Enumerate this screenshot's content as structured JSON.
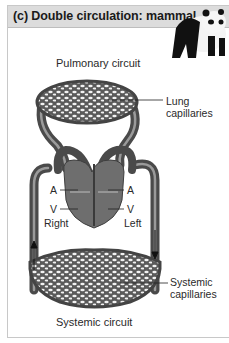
{
  "figure": {
    "title": "(c) Double circulation: mammal",
    "animal_icon": "panda-icon",
    "labels": {
      "pulmonary_circuit": "Pulmonary circuit",
      "lung_capillaries_line1": "Lung",
      "lung_capillaries_line2": "capillaries",
      "atrium_right": "A",
      "ventricle_right": "V",
      "side_right": "Right",
      "atrium_left": "A",
      "ventricle_left": "V",
      "side_left": "Left",
      "systemic_capillaries_line1": "Systemic",
      "systemic_capillaries_line2": "capillaries",
      "systemic_circuit": "Systemic circuit"
    },
    "colors": {
      "header_bg": "#dcdcdc",
      "vessel": "#555555",
      "vessel_highlight": "#9a9a9a",
      "heart": "#6e6e6e"
    }
  }
}
